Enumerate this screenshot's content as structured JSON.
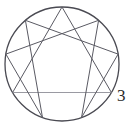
{
  "figure": {
    "name": "enneagram",
    "background_color": "#ffffff",
    "stroke_color": "#5a5a63",
    "circle_stroke_color": "#4a4a52",
    "accent_line_color": "#9a9aa2",
    "label_color": "#2b2b2b",
    "circle": {
      "center_x": 62,
      "center_y": 64,
      "radius": 57,
      "stroke_width": 1.3
    },
    "points": [
      {
        "number": "9",
        "angle_deg": 90,
        "x": 62.0,
        "y": 7.0
      },
      {
        "number": "1",
        "angle_deg": 50,
        "x": 98.6,
        "y": 20.3
      },
      {
        "number": "2",
        "angle_deg": 10,
        "x": 118.1,
        "y": 54.1
      },
      {
        "number": "3",
        "angle_deg": 330,
        "x": 111.4,
        "y": 92.5
      },
      {
        "number": "4",
        "angle_deg": 290,
        "x": 81.5,
        "y": 117.6
      },
      {
        "number": "5",
        "angle_deg": 250,
        "x": 42.5,
        "y": 117.6
      },
      {
        "number": "6",
        "angle_deg": 210,
        "x": 12.6,
        "y": 92.5
      },
      {
        "number": "7",
        "angle_deg": 170,
        "x": 5.9,
        "y": 54.1
      },
      {
        "number": "8",
        "angle_deg": 130,
        "x": 25.4,
        "y": 20.3
      }
    ],
    "triangle": {
      "name": "inner-triangle",
      "vertices": [
        "9",
        "3",
        "6"
      ],
      "stroke_width": 1.0
    },
    "hexad": {
      "name": "inner-hexad",
      "sequence": [
        "1",
        "4",
        "2",
        "8",
        "5",
        "7"
      ],
      "stroke_width": 1.0
    },
    "visible_labels": [
      {
        "name": "point-label-3",
        "text": "3",
        "x": 118,
        "y": 96
      }
    ]
  }
}
